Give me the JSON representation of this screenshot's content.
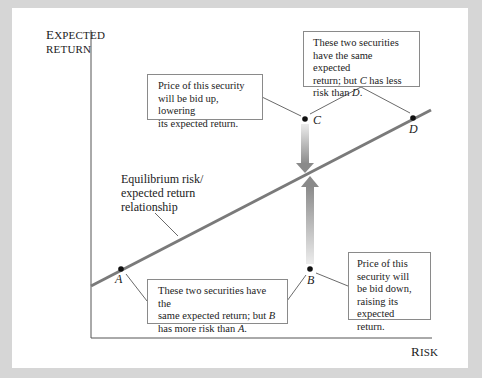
{
  "axes": {
    "y_label_first": "E",
    "y_label_rest": "XPECTED",
    "y_label_line2": "RETURN",
    "x_label_first": "R",
    "x_label_rest": "ISK"
  },
  "line_label": {
    "line1": "Equilibrium risk/",
    "line2": "expected return",
    "line3": "relationship"
  },
  "points": {
    "A": "A",
    "B": "B",
    "C": "C",
    "D": "D"
  },
  "callouts": {
    "cd_same_return": {
      "line1": "These two securities",
      "line2": "have the same expected",
      "line3_pre": "return; but ",
      "line3_var": "C",
      "line3_post": " has less",
      "line4_pre": "risk than ",
      "line4_var": "D",
      "line4_post": "."
    },
    "c_bid_up": {
      "line1": "Price of this security",
      "line2": "will be bid up, lowering",
      "line3": "its expected return."
    },
    "ab_same_return": {
      "line1": "These two securities have the",
      "line2_pre": "same expected return; but ",
      "line2_var": "B",
      "line3_pre": "has more risk than ",
      "line3_var": "A",
      "line3_post": "."
    },
    "b_bid_down": {
      "line1": "Price of this",
      "line2": "security will",
      "line3": "be bid down,",
      "line4": "raising its",
      "line5": "expected return."
    }
  },
  "colors": {
    "frame": "#d6d6d6",
    "panel": "#ffffff",
    "equilibrium_line": "#7a7a7a",
    "arrow_dark": "#8c8c8c",
    "arrow_light": "#e6e6e6",
    "axis": "#555555"
  }
}
